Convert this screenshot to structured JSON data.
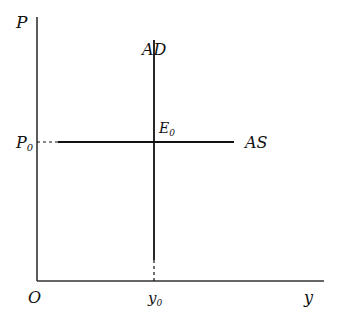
{
  "diagram": {
    "axes": {
      "y_label": "P",
      "x_label": "y",
      "origin_label": "O"
    },
    "curves": {
      "ad": {
        "label": "AD",
        "orientation": "vertical"
      },
      "as": {
        "label": "AS",
        "orientation": "horizontal"
      }
    },
    "equilibrium": {
      "label": "E",
      "subscript": "0"
    },
    "price_level": {
      "label": "P",
      "subscript": "0"
    },
    "output_level": {
      "label": "y",
      "subscript": "0"
    },
    "colors": {
      "line": "#111111",
      "background": "#ffffff"
    }
  }
}
